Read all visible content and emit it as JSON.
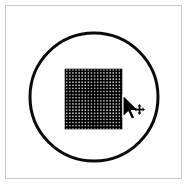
{
  "canvas": {
    "width": 189,
    "height": 186,
    "background_color": "#ffffff",
    "label": "Drawing canvas"
  },
  "frame": {
    "name": "canvas-frame",
    "border_color": "#c9c9c9",
    "border_width": 1,
    "x": 5,
    "y": 5,
    "width": 177,
    "height": 174,
    "label": "Canvas frame"
  },
  "shapes": [
    {
      "name": "circle-outline",
      "type": "circle",
      "label": "Circle outline",
      "stroke_color": "#000000",
      "fill_color": "none",
      "stroke_width": 3,
      "center_x": 94,
      "center_y": 97,
      "radius": 64
    },
    {
      "name": "patterned-square",
      "type": "square",
      "label": "Patterned square",
      "fill_color": "#000000",
      "pattern": "white-dot-grid",
      "pattern_dot_color": "#ffffff",
      "pattern_spacing": 3.1,
      "pattern_dot_size": 1.2,
      "x": 65,
      "y": 69,
      "width": 57,
      "height": 60
    }
  ],
  "cursor": {
    "name": "mouse-cursor",
    "label": "Mouse pointer with move handle",
    "type": "arrow-move",
    "color": "#000000",
    "outline_color": "#ffffff",
    "x": 123,
    "y": 95,
    "hotspot_x": 123,
    "hotspot_y": 95,
    "move_badge": {
      "name": "move-badge-icon",
      "label": "Four-way move indicator",
      "x": 134,
      "y": 104,
      "size": 11
    }
  }
}
